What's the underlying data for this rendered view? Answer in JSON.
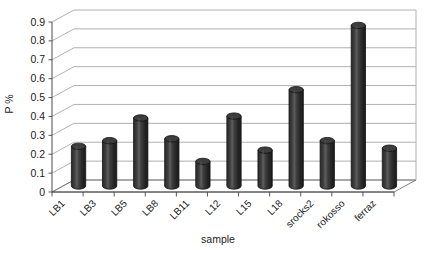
{
  "chart_data": {
    "type": "bar",
    "title": "",
    "subtitle": "",
    "xlabel": "sample",
    "ylabel": "P %",
    "categories": [
      "LB1",
      "LB3",
      "LB5",
      "LB8",
      "LB11",
      "L12",
      "L15",
      "L18",
      "srocks2",
      "rokosso",
      "ferraz"
    ],
    "values": [
      0.21,
      0.24,
      0.36,
      0.25,
      0.13,
      0.37,
      0.19,
      0.51,
      0.24,
      0.85,
      0.2
    ],
    "series": [
      {
        "name": "P %",
        "values": [
          0.21,
          0.24,
          0.36,
          0.25,
          0.13,
          0.37,
          0.19,
          0.51,
          0.24,
          0.85,
          0.2
        ]
      }
    ],
    "ylim": [
      0,
      0.9
    ],
    "ytick_labels": [
      "0.9",
      "0.8",
      "0.7",
      "0.6",
      "0.5",
      "0.4",
      "0.3",
      "0.2",
      "0.1",
      "0"
    ],
    "ytick_values": [
      0.9,
      0.8,
      0.7,
      0.6,
      0.5,
      0.4,
      0.3,
      0.2,
      0.1,
      0
    ],
    "grid": true,
    "grid_axis": "y",
    "legend": false,
    "legend_position": "none",
    "bar_style": "cylinder-3d",
    "annotations": []
  },
  "style": {
    "bar_color": "#2e2e2e",
    "bar_edge_color": "#111111",
    "bar_highlight_color": "#6a6a6a",
    "grid_color": "#a8a8a8",
    "axis_color": "#4a4a4a",
    "floor_color": "#6f6f6f",
    "background": "#ffffff",
    "text_color": "#1c1c1c"
  },
  "labels": {
    "x_axis_title": "sample",
    "y_axis_title": "P %"
  }
}
